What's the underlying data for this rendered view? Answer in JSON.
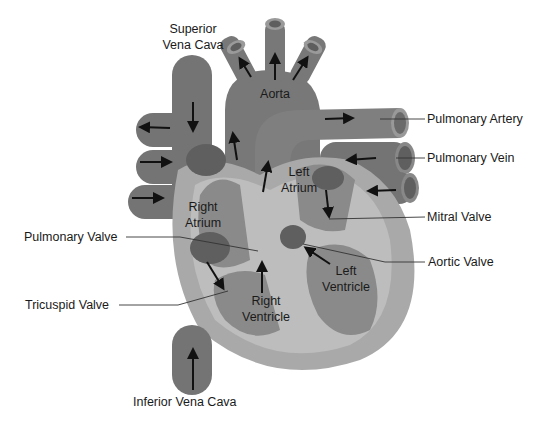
{
  "diagram": {
    "colors": {
      "vessel": "#747474",
      "vessel_dark": "#5e5e5e",
      "heart_outer": "#a9a9a9",
      "heart_wall": "#bdbdbd",
      "chamber": "#8a8a8a",
      "spot": "#5f5f5f",
      "label": "#1a1a1a",
      "background": "#ffffff"
    },
    "labels": {
      "superior_vena_cava_line1": "Superior",
      "superior_vena_cava_line2": "Vena Cava",
      "aorta": "Aorta",
      "pulmonary_artery": "Pulmonary Artery",
      "pulmonary_vein": "Pulmonary Vein",
      "left_atrium_line1": "Left",
      "left_atrium_line2": "Atrium",
      "right_atrium_line1": "Right",
      "right_atrium_line2": "Atrium",
      "mitral_valve": "Mitral Valve",
      "pulmonary_valve": "Pulmonary Valve",
      "aortic_valve": "Aortic Valve",
      "left_ventricle_line1": "Left",
      "left_ventricle_line2": "Ventricle",
      "right_ventricle_line1": "Right",
      "right_ventricle_line2": "Ventricle",
      "tricuspid_valve": "Tricuspid Valve",
      "inferior_vena_cava": "Inferior Vena Cava"
    }
  }
}
